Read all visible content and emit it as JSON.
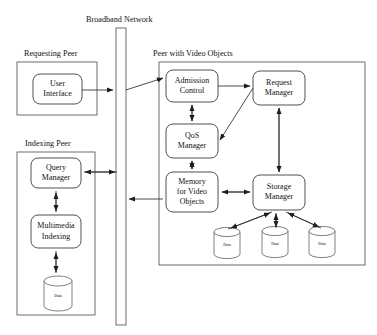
{
  "diagram": {
    "background_color": "#ffffff",
    "line_color": "#2b2b2b",
    "groups": [
      {
        "id": "requesting_peer",
        "label": "Requesting Peer"
      },
      {
        "id": "indexing_peer",
        "label": "Indexing Peer"
      },
      {
        "id": "video_peer",
        "label": "Peer with Video Objects"
      }
    ],
    "network": {
      "label": "Broadband Network"
    },
    "nodes": [
      {
        "id": "user_interface",
        "line1": "User",
        "line2": "Interface"
      },
      {
        "id": "query_manager",
        "line1": "Query",
        "line2": "Manager"
      },
      {
        "id": "multimedia_indexing",
        "line1": "Multimedia",
        "line2": "Indexing"
      },
      {
        "id": "admission_control",
        "line1": "Admission",
        "line2": "Control"
      },
      {
        "id": "request_manager",
        "line1": "Request",
        "line2": "Manager"
      },
      {
        "id": "qos_manager",
        "line1": "QoS",
        "line2": "Manager"
      },
      {
        "id": "memory_video_objects",
        "line1": "Memory",
        "line2": "for Video",
        "line3": "Objects"
      },
      {
        "id": "storage_manager",
        "line1": "Storage",
        "line2": "Manager"
      }
    ],
    "datastores": [
      {
        "id": "index_data",
        "label": "Data"
      },
      {
        "id": "video_data_1",
        "label": "Data"
      },
      {
        "id": "video_data_2",
        "label": "Data"
      },
      {
        "id": "video_data_3",
        "label": "Data"
      }
    ]
  }
}
